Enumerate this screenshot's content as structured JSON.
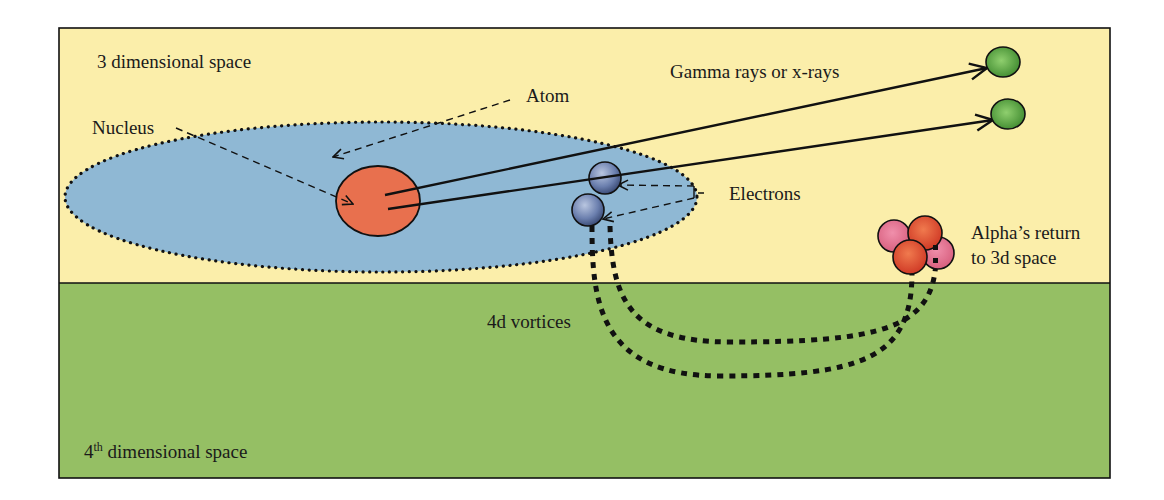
{
  "diagram": {
    "colors": {
      "space_3d": "#fbeeaa",
      "space_4d": "#95bf64",
      "atom_cloud": "#8fb8d4",
      "nucleus": "#e8704e",
      "electron": "#5b6f9c",
      "photon": "#4f9a3c",
      "alpha_red": "#d9472f",
      "alpha_pink": "#e0708e",
      "line": "#111111"
    },
    "regions": [
      {
        "id": "space_3d",
        "label": "3 dimensional space"
      },
      {
        "id": "space_4d",
        "label_prefix": "4",
        "label_sup": "th",
        "label_suffix": " dimensional space"
      }
    ],
    "labels": {
      "atom": "Atom",
      "nucleus": "Nucleus",
      "electrons": "Electrons",
      "gamma": "Gamma rays or x-rays",
      "alpha_line1": "Alpha’s return",
      "alpha_line2": "to 3d space",
      "vortices": "4d vortices"
    },
    "elements": {
      "nucleus_count": 1,
      "electron_count": 2,
      "photon_count": 2,
      "alpha_particles": 4,
      "vortex_paths": 2
    }
  }
}
